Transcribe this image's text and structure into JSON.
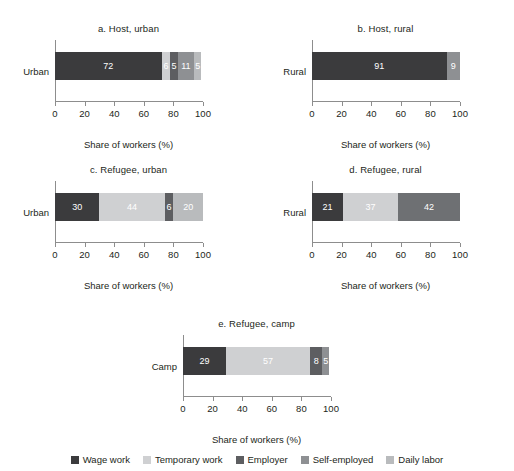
{
  "chart_data": {
    "type": "bar",
    "orientation": "horizontal",
    "stacked": true,
    "stack_total": 100,
    "xlabel": "Share of workers (%)",
    "ylabel": "",
    "xlim": [
      0,
      100
    ],
    "xticks": [
      0,
      20,
      40,
      60,
      80,
      100
    ],
    "grid": false,
    "legend_position": "bottom",
    "series": [
      {
        "name": "Wage work",
        "color": "#3b3b3d"
      },
      {
        "name": "Temporary work",
        "color": "#cfd0d2"
      },
      {
        "name": "Employer",
        "color": "#5d5e61"
      },
      {
        "name": "Self-employed",
        "color": "#8e9093"
      },
      {
        "name": "Daily labor",
        "color": "#b9bbbd"
      }
    ],
    "panels": [
      {
        "title": "a. Host, urban",
        "categories": [
          "Urban"
        ],
        "segments": [
          {
            "series": "Wage work",
            "value": 72,
            "label": "72"
          },
          {
            "series": "Temporary work",
            "value": 6,
            "label": "6"
          },
          {
            "series": "Employer",
            "value": 5,
            "label": "5"
          },
          {
            "series": "Self-employed",
            "value": 11,
            "label": "11"
          },
          {
            "series": "Daily labor",
            "value": 5,
            "label": "5"
          }
        ]
      },
      {
        "title": "b. Host, rural",
        "categories": [
          "Rural"
        ],
        "segments": [
          {
            "series": "Wage work",
            "value": 91,
            "label": "91"
          },
          {
            "series": "Self-employed",
            "value": 9,
            "label": "9"
          }
        ]
      },
      {
        "title": "c. Refugee, urban",
        "categories": [
          "Urban"
        ],
        "segments": [
          {
            "series": "Wage work",
            "value": 30,
            "label": "30"
          },
          {
            "series": "Temporary work",
            "value": 44,
            "label": "44"
          },
          {
            "series": "Employer",
            "value": 6,
            "label": "6"
          },
          {
            "series": "Self-employed",
            "value": 20,
            "label": "20"
          }
        ]
      },
      {
        "title": "d. Refugee, rural",
        "categories": [
          "Rural"
        ],
        "segments": [
          {
            "series": "Wage work",
            "value": 21,
            "label": "21"
          },
          {
            "series": "Temporary work",
            "value": 37,
            "label": "37"
          },
          {
            "series": "Self-employed",
            "value": 42,
            "label": "42"
          }
        ]
      },
      {
        "title": "e. Refugee, camp",
        "categories": [
          "Camp"
        ],
        "segments": [
          {
            "series": "Wage work",
            "value": 29,
            "label": "29"
          },
          {
            "series": "Temporary work",
            "value": 57,
            "label": "57"
          },
          {
            "series": "Employer",
            "value": 8,
            "label": "8"
          },
          {
            "series": "Self-employed",
            "value": 5,
            "label": "5"
          }
        ]
      }
    ]
  },
  "panels": {
    "a": {
      "title": "a. Host, urban",
      "category_label": "Urban",
      "axis_title": "Share of workers (%)",
      "ticks": [
        "0",
        "20",
        "40",
        "60",
        "80",
        "100"
      ],
      "segments": [
        {
          "label": "72",
          "value": 72,
          "color": "#3b3b3d",
          "text": "light"
        },
        {
          "label": "6",
          "value": 6,
          "color": "#cfd0d2",
          "text": "light"
        },
        {
          "label": "5",
          "value": 5,
          "color": "#5d5e61",
          "text": "light"
        },
        {
          "label": "11",
          "value": 11,
          "color": "#8e9093",
          "text": "light"
        },
        {
          "label": "5",
          "value": 5,
          "color": "#b9bbbd",
          "text": "light"
        }
      ]
    },
    "b": {
      "title": "b. Host, rural",
      "category_label": "Rural",
      "axis_title": "Share of workers (%)",
      "ticks": [
        "0",
        "20",
        "40",
        "60",
        "80",
        "100"
      ],
      "segments": [
        {
          "label": "91",
          "value": 91,
          "color": "#3b3b3d",
          "text": "light"
        },
        {
          "label": "9",
          "value": 9,
          "color": "#8e9093",
          "text": "light"
        }
      ]
    },
    "c": {
      "title": "c. Refugee, urban",
      "category_label": "Urban",
      "axis_title": "Share of workers (%)",
      "ticks": [
        "0",
        "20",
        "40",
        "60",
        "80",
        "100"
      ],
      "segments": [
        {
          "label": "30",
          "value": 30,
          "color": "#3b3b3d",
          "text": "light"
        },
        {
          "label": "44",
          "value": 44,
          "color": "#cfd0d2",
          "text": "light"
        },
        {
          "label": "6",
          "value": 6,
          "color": "#5d5e61",
          "text": "light"
        },
        {
          "label": "20",
          "value": 20,
          "color": "#b9bbbd",
          "text": "light"
        }
      ]
    },
    "d": {
      "title": "d. Refugee, rural",
      "category_label": "Rural",
      "axis_title": "Share of workers (%)",
      "ticks": [
        "0",
        "20",
        "40",
        "60",
        "80",
        "100"
      ],
      "segments": [
        {
          "label": "21",
          "value": 21,
          "color": "#3b3b3d",
          "text": "light"
        },
        {
          "label": "37",
          "value": 37,
          "color": "#cfd0d2",
          "text": "light"
        },
        {
          "label": "42",
          "value": 42,
          "color": "#6e7073",
          "text": "light"
        }
      ]
    },
    "e": {
      "title": "e. Refugee, camp",
      "category_label": "Camp",
      "axis_title": "Share of workers (%)",
      "ticks": [
        "0",
        "20",
        "40",
        "60",
        "80",
        "100"
      ],
      "segments": [
        {
          "label": "29",
          "value": 29,
          "color": "#3b3b3d",
          "text": "light"
        },
        {
          "label": "57",
          "value": 57,
          "color": "#cfd0d2",
          "text": "light"
        },
        {
          "label": "8",
          "value": 8,
          "color": "#5d5e61",
          "text": "light"
        },
        {
          "label": "5",
          "value": 5,
          "color": "#8e9093",
          "text": "light"
        }
      ]
    }
  },
  "legend": {
    "items": [
      {
        "label": "Wage work",
        "color": "#3b3b3d"
      },
      {
        "label": "Temporary work",
        "color": "#cfd0d2"
      },
      {
        "label": "Employer",
        "color": "#5d5e61"
      },
      {
        "label": "Self-employed",
        "color": "#8e9093"
      },
      {
        "label": "Daily labor",
        "color": "#b9bbbd"
      }
    ]
  }
}
